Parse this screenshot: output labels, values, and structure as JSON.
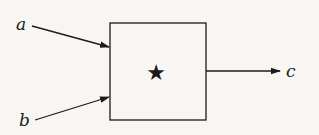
{
  "diagram": {
    "type": "block-diagram",
    "operator": {
      "symbol": "★",
      "icon": "star-icon",
      "shape": "square-box"
    },
    "inputs": [
      {
        "label": "a"
      },
      {
        "label": "b"
      }
    ],
    "outputs": [
      {
        "label": "c"
      }
    ],
    "colors": {
      "ink": "#1c1a1a",
      "background": "#f7f6f2"
    }
  }
}
